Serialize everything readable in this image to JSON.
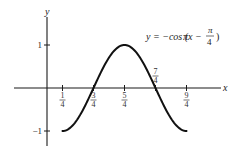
{
  "chart_data": {
    "type": "line",
    "title": "",
    "equation": {
      "lhs": "y = −cos (",
      "pi_x": "πx − ",
      "frac_num": "π",
      "frac_den": "4",
      "close": ")"
    },
    "xlabel": "x",
    "ylabel": "y",
    "xlim": [
      -0.5,
      2.8
    ],
    "ylim": [
      -1.3,
      1.6
    ],
    "grid": false,
    "x_ticks": [
      {
        "value": 0.25,
        "num": "1",
        "den": "4",
        "position": "below"
      },
      {
        "value": 0.75,
        "num": "3",
        "den": "4",
        "position": "below"
      },
      {
        "value": 1.25,
        "num": "5",
        "den": "4",
        "position": "below"
      },
      {
        "value": 1.75,
        "num": "7",
        "den": "4",
        "position": "above"
      },
      {
        "value": 2.25,
        "num": "9",
        "den": "4",
        "position": "below"
      }
    ],
    "y_ticks": [
      {
        "value": 1,
        "label": "1"
      },
      {
        "value": -1,
        "label": "−1"
      }
    ],
    "series": [
      {
        "name": "y = −cos(πx − π/4)",
        "function": "-cos(pi*x - pi/4)",
        "x_range": [
          0.25,
          2.25
        ],
        "points": [
          [
            0.25,
            -1
          ],
          [
            0.5,
            -0.707
          ],
          [
            0.75,
            0
          ],
          [
            1.0,
            0.707
          ],
          [
            1.25,
            1
          ],
          [
            1.5,
            0.707
          ],
          [
            1.75,
            0
          ],
          [
            2.0,
            -0.707
          ],
          [
            2.25,
            -1
          ]
        ]
      }
    ]
  }
}
